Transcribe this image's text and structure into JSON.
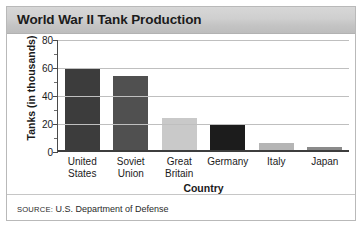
{
  "figure": {
    "title": "World War II Tank Production",
    "source_prefix": "SOURCE:",
    "source_text": " U.S. Department of Defense"
  },
  "chart_data": {
    "type": "bar",
    "title": "World War II Tank Production",
    "xlabel": "Country",
    "ylabel": "Tanks (in thousands)",
    "categories": [
      "United States",
      "Soviet Union",
      "Great Britain",
      "Germany",
      "Italy",
      "Japan"
    ],
    "category_lines": [
      [
        "United",
        "States"
      ],
      [
        "Soviet",
        "Union"
      ],
      [
        "Great",
        "Britain"
      ],
      [
        "Germany"
      ],
      [
        "Italy"
      ],
      [
        "Japan"
      ]
    ],
    "values": [
      60,
      54,
      23,
      18.5,
      5,
      2
    ],
    "bar_colors": [
      "#3c3c3c",
      "#505050",
      "#c9c9c9",
      "#1c1c1c",
      "#b5b5b5",
      "#8a8a8a"
    ],
    "ylim": [
      0,
      80
    ],
    "yticks": [
      0,
      20,
      40,
      60,
      80
    ],
    "ytick_labels": [
      "0",
      "20",
      "40",
      "60",
      "80"
    ],
    "grid": true,
    "legend": "none",
    "source": "SOURCE: U.S. Department of Defense"
  }
}
